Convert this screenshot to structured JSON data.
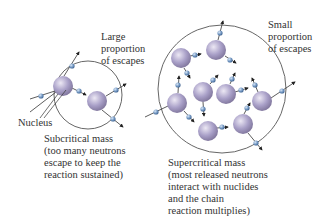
{
  "labels": {
    "large_escapes": "Large\nproportion\nof escapes",
    "small_escapes": "Small\nproportion\nof escapes",
    "nucleus": "Nucleus",
    "subcritical": "Subcritical mass\n(too many neutrons\nescape to keep the\nreaction sustained)",
    "supercritical": "Supercritical mass\n(most released neutrons\ninteract with nuclides\nand the chain\nreaction multiplies)"
  },
  "colors": {
    "nucleus": "#a59cc4",
    "nucleus_highlight": "#e6e1f0",
    "neutron": "#6f94c0",
    "circle_stroke": "#555555",
    "arrow": "#222222"
  },
  "diagram": {
    "subcritical_mass": {
      "boundary": {
        "cx": 88,
        "cy": 95,
        "r": 34
      },
      "nuclei": [
        {
          "cx": 63,
          "cy": 86,
          "r": 10
        },
        {
          "cx": 97,
          "cy": 101,
          "r": 10
        }
      ]
    },
    "supercritical_mass": {
      "boundary": {
        "cx": 222,
        "cy": 89,
        "r": 64
      },
      "nuclei": [
        {
          "cx": 216,
          "cy": 50,
          "r": 10
        },
        {
          "cx": 181,
          "cy": 58,
          "r": 10
        },
        {
          "cx": 203,
          "cy": 92,
          "r": 10
        },
        {
          "cx": 226,
          "cy": 94,
          "r": 10
        },
        {
          "cx": 177,
          "cy": 103,
          "r": 10
        },
        {
          "cx": 262,
          "cy": 101,
          "r": 10
        },
        {
          "cx": 208,
          "cy": 131,
          "r": 10
        },
        {
          "cx": 243,
          "cy": 124,
          "r": 10
        }
      ]
    }
  }
}
